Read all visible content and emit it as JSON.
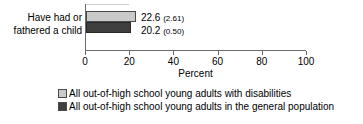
{
  "chart_data": {
    "type": "bar",
    "orientation": "horizontal",
    "title": "",
    "xlabel": "Percent",
    "ylabel": "",
    "xlim": [
      0,
      100
    ],
    "xticks": [
      0,
      20,
      40,
      60,
      80,
      100
    ],
    "grid": false,
    "legend_position": "bottom",
    "categories": [
      "Have had or\nfathered a child"
    ],
    "series": [
      {
        "name": "All out-of-high school young adults with disabilities",
        "color": "#c9c9c9",
        "values": [
          22.6
        ],
        "standard_errors": [
          2.61
        ],
        "data_labels": [
          "22.6 (2.61)"
        ]
      },
      {
        "name": "All out-of-high school young adults in the general population",
        "color": "#3f3f3f",
        "values": [
          20.2
        ],
        "standard_errors": [
          0.5
        ],
        "data_labels": [
          "20.2 (0.50)"
        ]
      }
    ]
  },
  "category_label": "Have had or\nfathered a child",
  "axis": {
    "title": "Percent",
    "ticks": [
      {
        "value": 0,
        "label": "0"
      },
      {
        "value": 20,
        "label": "20"
      },
      {
        "value": 40,
        "label": "40"
      },
      {
        "value": 60,
        "label": "60"
      },
      {
        "value": 80,
        "label": "80"
      },
      {
        "value": 100,
        "label": "100"
      }
    ]
  },
  "values": {
    "bar1_number": "22.6",
    "bar1_se": "(2.61)",
    "bar2_number": "20.2",
    "bar2_se": "(0.50)"
  },
  "legend": {
    "items": [
      {
        "label": "All out-of-high school young adults with disabilities",
        "color": "#c9c9c9"
      },
      {
        "label": "All out-of-high school young adults in the general population",
        "color": "#3f3f3f"
      }
    ]
  }
}
